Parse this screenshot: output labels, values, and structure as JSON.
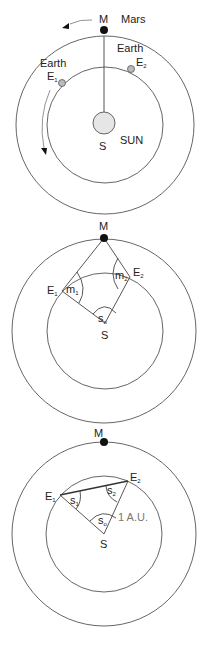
{
  "colors": {
    "background": "#ffffff",
    "orbit_stroke": "#555555",
    "mars_fill": "#111111",
    "earth_fill": "#bbbbbb",
    "sun_fill": "#e6e6e6",
    "au_label": "#777777"
  },
  "diagram1": {
    "mars_marker": "M",
    "mars_name": "Mars",
    "earth1_name": "Earth",
    "earth1_marker": "E",
    "earth1_sub": "1",
    "earth2_name": "Earth",
    "earth2_marker": "E",
    "earth2_sub": "2",
    "sun_marker": "S",
    "sun_name": "SUN"
  },
  "diagram2": {
    "mars_marker": "M",
    "earth1_marker": "E",
    "earth1_sub": "1",
    "earth2_marker": "E",
    "earth2_sub": "2",
    "sun_marker": "S",
    "angle_m1": "m",
    "angle_m1_sub": "1",
    "angle_m2": "m",
    "angle_m2_sub": "2",
    "angle_s0": "s",
    "angle_s0_sub": "o"
  },
  "diagram3": {
    "mars_marker": "M",
    "earth1_marker": "E",
    "earth1_sub": "1",
    "earth2_marker": "E",
    "earth2_sub": "2",
    "sun_marker": "S",
    "angle_s1": "s",
    "angle_s1_sub": "1",
    "angle_s2": "s",
    "angle_s2_sub": "2",
    "angle_s0": "s",
    "angle_s0_sub": "o",
    "distance_label": "1 A.U."
  }
}
